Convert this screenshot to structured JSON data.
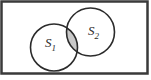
{
  "figure": {
    "type": "venn-diagram",
    "sets": [
      {
        "id": "s1",
        "label_base": "S",
        "label_sub": "1"
      },
      {
        "id": "s2",
        "label_base": "S",
        "label_sub": "2"
      }
    ],
    "shaded_region": "intersection",
    "colors": {
      "background": "#ffffff",
      "frame_border": "#3a3a3a",
      "circle_outline": "#2b2b2b",
      "intersection_fill": "#c9c9c9",
      "circle_fill": "#ffffff"
    }
  }
}
